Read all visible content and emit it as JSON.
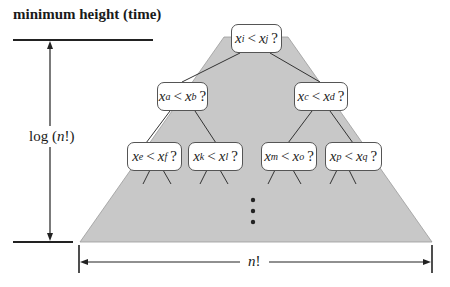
{
  "diagram": {
    "title": "minimum height (time)",
    "height_label": {
      "prefix": "log (",
      "var": "n",
      "suffix": "!)"
    },
    "width_label": {
      "var": "n",
      "suffix": "!"
    },
    "colors": {
      "tree_fill": "#c8c8c8",
      "line": "#333333",
      "node_border": "#555555",
      "node_fill": "#ffffff"
    },
    "ellipsis": "⋮",
    "nodes": [
      {
        "id": "root",
        "left": "x",
        "left_sub": "i",
        "op": "<",
        "right": "x",
        "right_sub": "j",
        "q": "?"
      },
      {
        "id": "l2-left",
        "left": "x",
        "left_sub": "a",
        "op": "<",
        "right": "x",
        "right_sub": "b",
        "q": "?"
      },
      {
        "id": "l2-right",
        "left": "x",
        "left_sub": "c",
        "op": "<",
        "right": "x",
        "right_sub": "d",
        "q": "?"
      },
      {
        "id": "l3-1",
        "left": "x",
        "left_sub": "e",
        "op": "<",
        "right": "x",
        "right_sub": "f",
        "q": "?"
      },
      {
        "id": "l3-2",
        "left": "x",
        "left_sub": "k",
        "op": "<",
        "right": "x",
        "right_sub": "l",
        "q": "?"
      },
      {
        "id": "l3-3",
        "left": "x",
        "left_sub": "m",
        "op": "<",
        "right": "x",
        "right_sub": "o",
        "q": "?"
      },
      {
        "id": "l3-4",
        "left": "x",
        "left_sub": "p",
        "op": "<",
        "right": "x",
        "right_sub": "q",
        "q": "?"
      }
    ]
  }
}
